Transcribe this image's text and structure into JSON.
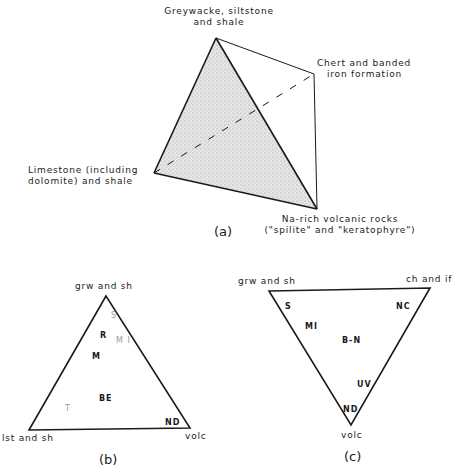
{
  "figure_a": {
    "caption": "(a)",
    "vertices": {
      "top": [
        "Greywacke, siltstone",
        "and shale"
      ],
      "right": [
        "Chert and banded",
        "iron formation"
      ],
      "left": [
        "Limestone (including",
        "dolomite) and shale"
      ],
      "bottom": [
        "Na-rich volcanic rocks",
        "(\"spilite\" and \"keratophyre\")"
      ]
    }
  },
  "figure_b": {
    "caption": "(b)",
    "vertices": {
      "top": "grw and sh",
      "left": "lst and sh",
      "right": "volc"
    },
    "points": {
      "S": "S",
      "R": "R",
      "MI": "M I",
      "M": "M",
      "BE": "BE",
      "T": "T",
      "ND": "ND"
    }
  },
  "figure_c": {
    "caption": "(c)",
    "vertices": {
      "left": "grw and sh",
      "right": "ch and if",
      "bottom": "volc"
    },
    "points": {
      "S": "S",
      "NC": "NC",
      "MI": "MI",
      "BN": "B-N",
      "UV": "UV",
      "ND": "ND"
    }
  }
}
